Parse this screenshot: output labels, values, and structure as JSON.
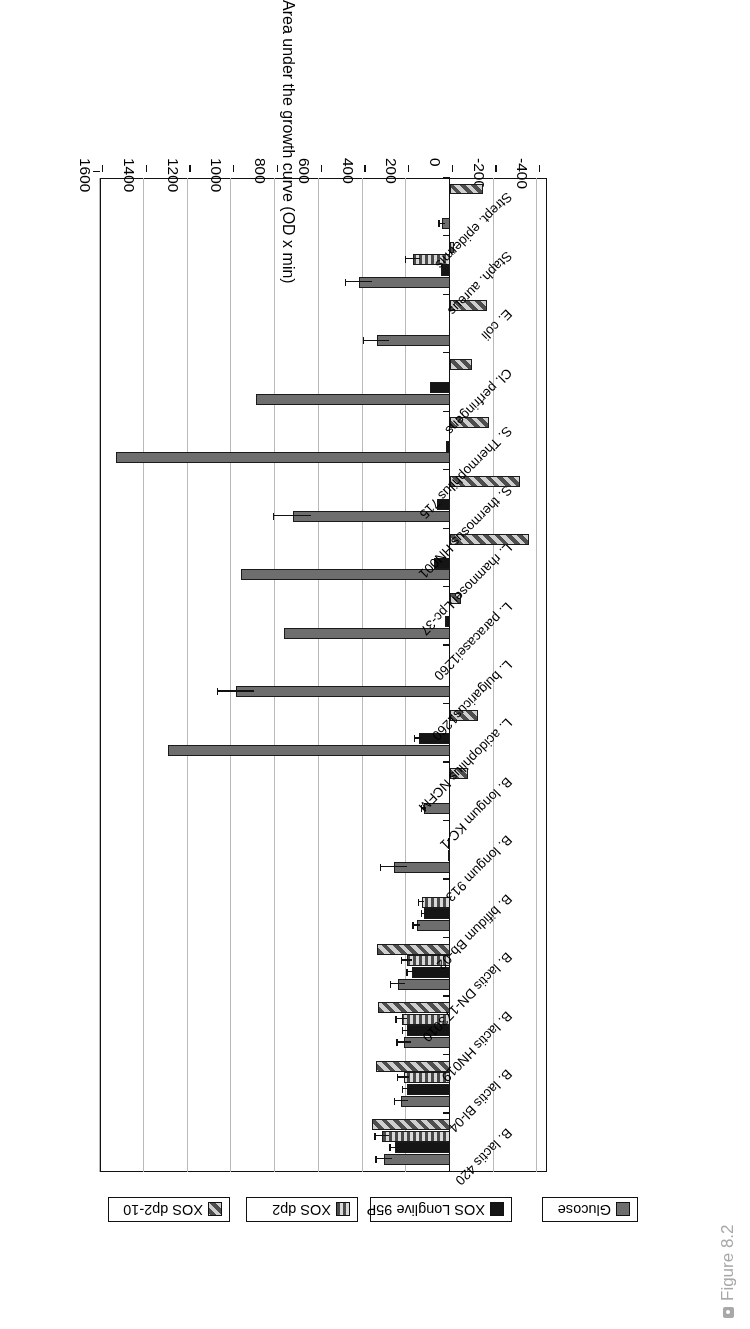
{
  "caption": {
    "text": "Figure 8.2",
    "bullet_icon": "bullet-square-icon"
  },
  "chart_data": {
    "type": "bar",
    "orientation": "horizontal-rotated-180",
    "title": "",
    "xlabel": "",
    "ylabel": "Area under the growth curve (OD x min)",
    "axis_title": "Area under the growth curve (OD x min)",
    "ylim": [
      -400,
      1600
    ],
    "tick_labels": [
      "1600",
      "1400",
      "1200",
      "1000",
      "800",
      "600",
      "400",
      "200",
      "0",
      "-200",
      "-400"
    ],
    "tick_values": [
      1600,
      1400,
      1200,
      1000,
      800,
      600,
      400,
      200,
      0,
      -200,
      -400
    ],
    "grid": true,
    "legend_position": "top",
    "legend": [
      "Glucose",
      "XOS Longlive 95P",
      "XOS dp2",
      "XOS dp2-10"
    ],
    "colors": {
      "glucose": "#6e6e6e",
      "xos_longlive_95p": "#151515",
      "xos_dp2": "#7a7a7a",
      "xos_dp2_10": "#8a8a8a",
      "gridline": "#b9b9b9",
      "axis": "#111111",
      "caption": "#a8a8a8"
    },
    "categories": [
      "B. lactis 420",
      "B. lactis Bl-04",
      "B. lactis HN019",
      "B. lactis DN-173010",
      "B. bifidum Bb-02",
      "B. longum 913",
      "B. longum KC-1",
      "L. acidophilus NCFM",
      "L. bulgaricus1260",
      "L. paracasei1260",
      "L. rhamnosei Lpc-37",
      "S. thermosus HN001",
      "S. Thermophilus 715",
      "Cl. perfringens",
      "E. coli",
      "Staph. aureus",
      "Strept. epidermis"
    ],
    "series": [
      {
        "name": "Glucose",
        "values": [
          300,
          222,
          210,
          238,
          152,
          255,
          118,
          1290,
          980,
          760,
          955,
          720,
          1530,
          890,
          335,
          415,
          36
        ],
        "errors": [
          36,
          30,
          30,
          30,
          14,
          60,
          10,
          0,
          82,
          0,
          0,
          86,
          0,
          0,
          58,
          60,
          12
        ]
      },
      {
        "name": "XOS Longlive 95P",
        "values": [
          250,
          196,
          196,
          176,
          118,
          10,
          0,
          142,
          0,
          22,
          74,
          58,
          20,
          92,
          0,
          42,
          0
        ],
        "errors": [
          22,
          20,
          18,
          18,
          10,
          0,
          0,
          16,
          0,
          0,
          0,
          0,
          0,
          0,
          0,
          0,
          0
        ]
      },
      {
        "name": "XOS dp2",
        "values": [
          310,
          212,
          220,
          196,
          130,
          5,
          0,
          0,
          0,
          0,
          0,
          0,
          0,
          0,
          0,
          170,
          0
        ],
        "errors": [
          30,
          25,
          24,
          22,
          12,
          0,
          0,
          0,
          0,
          0,
          0,
          0,
          0,
          0,
          0,
          32,
          0
        ]
      },
      {
        "name": "XOS dp2-10",
        "values": [
          355,
          340,
          330,
          335,
          0,
          0,
          -82,
          -130,
          0,
          -50,
          -360,
          -320,
          -180,
          -100,
          -168,
          -20,
          -150
        ],
        "errors": [
          0,
          0,
          0,
          0,
          0,
          0,
          0,
          0,
          0,
          0,
          0,
          0,
          0,
          0,
          0,
          0,
          0
        ]
      }
    ]
  }
}
